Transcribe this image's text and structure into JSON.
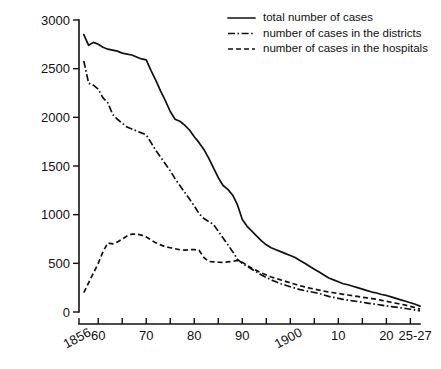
{
  "chart_data": {
    "type": "line",
    "title": "",
    "subtitle": "",
    "xlabel": "",
    "ylabel": "",
    "xlim": [
      1856,
      1927
    ],
    "ylim": [
      0,
      3000
    ],
    "grid": false,
    "legend_position": "top-right",
    "y_ticks": [
      0,
      500,
      1000,
      1500,
      2000,
      2500,
      3000
    ],
    "y_tick_labels": [
      "0",
      "500",
      "1000",
      "1500",
      "2000",
      "2500",
      "3000"
    ],
    "x_ticks": [
      1856,
      1860,
      1865,
      1870,
      1875,
      1880,
      1885,
      1890,
      1895,
      1900,
      1905,
      1910,
      1915,
      1920,
      1925
    ],
    "x_tick_labels": [
      {
        "value": 1856,
        "label": "1856",
        "rotated": true
      },
      {
        "value": 1860,
        "label": "60",
        "rotated": false
      },
      {
        "value": 1870,
        "label": "70",
        "rotated": false
      },
      {
        "value": 1880,
        "label": "80",
        "rotated": false
      },
      {
        "value": 1890,
        "label": "90",
        "rotated": false
      },
      {
        "value": 1900,
        "label": "1900",
        "rotated": true
      },
      {
        "value": 1910,
        "label": "10",
        "rotated": false
      },
      {
        "value": 1920,
        "label": "20",
        "rotated": false
      },
      {
        "value": 1926,
        "label": "25-27",
        "rotated": false
      }
    ],
    "series": [
      {
        "name": "total number of cases",
        "style": "solid",
        "color": "#111111",
        "x": [
          1857,
          1858,
          1859,
          1860,
          1861,
          1862,
          1863,
          1864,
          1865,
          1866,
          1867,
          1868,
          1869,
          1870,
          1871,
          1872,
          1873,
          1874,
          1875,
          1876,
          1877,
          1878,
          1879,
          1880,
          1881,
          1882,
          1883,
          1884,
          1885,
          1886,
          1887,
          1888,
          1889,
          1890,
          1891,
          1892,
          1893,
          1894,
          1895,
          1896,
          1897,
          1898,
          1899,
          1900,
          1901,
          1902,
          1903,
          1904,
          1905,
          1906,
          1907,
          1908,
          1909,
          1910,
          1911,
          1912,
          1913,
          1914,
          1915,
          1916,
          1917,
          1918,
          1919,
          1920,
          1921,
          1922,
          1923,
          1924,
          1925,
          1926,
          1927
        ],
        "values": [
          2850,
          2740,
          2770,
          2750,
          2720,
          2700,
          2690,
          2680,
          2660,
          2650,
          2640,
          2620,
          2600,
          2590,
          2480,
          2380,
          2270,
          2170,
          2060,
          1980,
          1960,
          1920,
          1870,
          1800,
          1740,
          1670,
          1580,
          1480,
          1380,
          1300,
          1260,
          1200,
          1100,
          950,
          880,
          830,
          780,
          730,
          690,
          660,
          640,
          620,
          600,
          580,
          560,
          530,
          500,
          470,
          440,
          410,
          380,
          350,
          330,
          310,
          290,
          280,
          265,
          250,
          235,
          220,
          205,
          195,
          180,
          170,
          155,
          140,
          125,
          110,
          95,
          80,
          60
        ]
      },
      {
        "name": "number of cases in the districts",
        "style": "dashdot",
        "color": "#111111",
        "x": [
          1857,
          1858,
          1859,
          1860,
          1861,
          1862,
          1863,
          1864,
          1865,
          1866,
          1867,
          1868,
          1869,
          1870,
          1871,
          1872,
          1873,
          1874,
          1875,
          1876,
          1877,
          1878,
          1879,
          1880,
          1881,
          1882,
          1883,
          1884,
          1885,
          1886,
          1887,
          1888,
          1889,
          1890,
          1891,
          1892,
          1893,
          1894,
          1895,
          1896,
          1897,
          1898,
          1899,
          1900,
          1901,
          1902,
          1903,
          1904,
          1905,
          1906,
          1907,
          1908,
          1909,
          1910,
          1911,
          1912,
          1913,
          1914,
          1915,
          1916,
          1917,
          1918,
          1919,
          1920,
          1921,
          1922,
          1923,
          1924,
          1925,
          1926,
          1927
        ],
        "values": [
          2580,
          2350,
          2330,
          2290,
          2200,
          2150,
          2030,
          1980,
          1940,
          1900,
          1880,
          1860,
          1840,
          1820,
          1740,
          1660,
          1590,
          1520,
          1450,
          1370,
          1300,
          1230,
          1160,
          1090,
          1010,
          960,
          930,
          900,
          830,
          760,
          690,
          620,
          540,
          500,
          470,
          440,
          410,
          380,
          355,
          330,
          310,
          290,
          275,
          260,
          245,
          230,
          220,
          210,
          200,
          190,
          175,
          160,
          150,
          140,
          130,
          122,
          115,
          108,
          100,
          92,
          85,
          78,
          70,
          63,
          56,
          50,
          43,
          36,
          28,
          20,
          12
        ]
      },
      {
        "name": "number of cases in the hospitals",
        "style": "dashed",
        "color": "#111111",
        "x": [
          1857,
          1858,
          1859,
          1860,
          1861,
          1862,
          1863,
          1864,
          1865,
          1866,
          1867,
          1868,
          1869,
          1870,
          1871,
          1872,
          1873,
          1874,
          1875,
          1876,
          1877,
          1878,
          1879,
          1880,
          1881,
          1882,
          1883,
          1884,
          1885,
          1886,
          1887,
          1888,
          1889,
          1890,
          1891,
          1892,
          1893,
          1894,
          1895,
          1896,
          1897,
          1898,
          1899,
          1900,
          1901,
          1902,
          1903,
          1904,
          1905,
          1906,
          1907,
          1908,
          1909,
          1910,
          1911,
          1912,
          1913,
          1914,
          1915,
          1916,
          1917,
          1918,
          1919,
          1920,
          1921,
          1922,
          1923,
          1924,
          1925,
          1926,
          1927
        ],
        "values": [
          200,
          300,
          400,
          500,
          620,
          710,
          700,
          720,
          750,
          780,
          800,
          800,
          790,
          770,
          740,
          710,
          690,
          670,
          660,
          650,
          640,
          635,
          640,
          640,
          635,
          560,
          520,
          515,
          512,
          510,
          515,
          520,
          530,
          510,
          480,
          450,
          425,
          400,
          380,
          360,
          345,
          330,
          315,
          300,
          285,
          270,
          258,
          246,
          235,
          225,
          215,
          205,
          198,
          190,
          182,
          175,
          168,
          160,
          152,
          145,
          138,
          130,
          120,
          110,
          100,
          90,
          80,
          70,
          58,
          45,
          30
        ]
      }
    ]
  },
  "legend": {
    "entries": [
      {
        "label": "total number of cases",
        "style": "solid"
      },
      {
        "label": "number of cases in the districts",
        "style": "dashdot"
      },
      {
        "label": "number of cases in the hospitals",
        "style": "dashed"
      }
    ]
  }
}
